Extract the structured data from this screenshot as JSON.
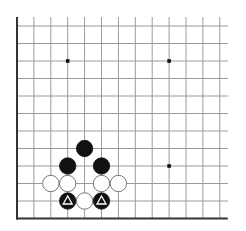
{
  "board": {
    "title": "Go board diagram (lower-left corner)",
    "grid": {
      "origin_x": 17,
      "origin_y": 218.5,
      "dx": 16.9,
      "dy": 17.5,
      "cols": 13,
      "rows": 12,
      "right_edge_open": true,
      "top_edge_open": true
    },
    "colors": {
      "line": "#9a9a9a",
      "edge": "#333333",
      "black": "#111111",
      "white": "#ffffff",
      "stone_outline": "#555555"
    },
    "hoshi": [
      {
        "c": 3,
        "r": 9
      },
      {
        "c": 9,
        "r": 9
      },
      {
        "c": 9,
        "r": 3
      }
    ],
    "stones": [
      {
        "c": 4,
        "r": 4,
        "color": "black"
      },
      {
        "c": 3,
        "r": 3,
        "color": "black"
      },
      {
        "c": 5,
        "r": 3,
        "color": "black"
      },
      {
        "c": 2,
        "r": 2,
        "color": "white"
      },
      {
        "c": 3,
        "r": 2,
        "color": "white"
      },
      {
        "c": 5,
        "r": 2,
        "color": "white"
      },
      {
        "c": 6,
        "r": 2,
        "color": "white"
      },
      {
        "c": 3,
        "r": 1,
        "color": "black",
        "mark": "triangle"
      },
      {
        "c": 4,
        "r": 1,
        "color": "white"
      },
      {
        "c": 5,
        "r": 1,
        "color": "black",
        "mark": "triangle"
      }
    ]
  }
}
